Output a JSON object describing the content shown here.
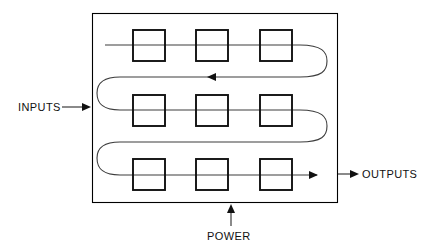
{
  "diagram": {
    "labels": {
      "inputs": "INPUTS",
      "outputs": "OUTPUTS",
      "power": "POWER"
    },
    "colors": {
      "background": "#ffffff",
      "enclosure_stroke": "#000000",
      "module_stroke": "#111111",
      "flow_stroke": "#3c3c3c",
      "lead_stroke": "#2a2a2a",
      "text": "#111111"
    },
    "enclosure": {
      "x": 92,
      "y": 13,
      "width": 246,
      "height": 190
    },
    "module_grid": {
      "rows": 3,
      "columns": 3,
      "box_width": 32,
      "box_height": 31,
      "column_x": [
        133,
        196,
        260
      ],
      "row_y": [
        30,
        95,
        159
      ]
    },
    "flow": {
      "row_line_y": [
        45,
        110,
        175
      ],
      "direction_by_row": [
        "right",
        "left",
        "right"
      ],
      "entry_x": 105,
      "exit_x": 330,
      "turn_right_x": 316,
      "turn_left_x": 108
    },
    "ports": [
      {
        "name": "inputs",
        "label": "INPUTS",
        "side": "left",
        "label_x": 18,
        "label_y": 111,
        "lead_from_x": 62,
        "lead_to_x": 90,
        "lead_y": 107,
        "arrow_direction": "right"
      },
      {
        "name": "outputs",
        "label": "OUTPUTS",
        "side": "right",
        "label_x": 360,
        "label_y": 178,
        "lead_from_x": 338,
        "lead_to_x": 357,
        "lead_y": 174,
        "arrow_direction": "right"
      },
      {
        "name": "power",
        "label": "POWER",
        "side": "bottom",
        "label_x": 207,
        "label_y": 238,
        "lead_from_y": 226,
        "lead_to_y": 205,
        "lead_x": 231,
        "arrow_direction": "up"
      }
    ]
  }
}
